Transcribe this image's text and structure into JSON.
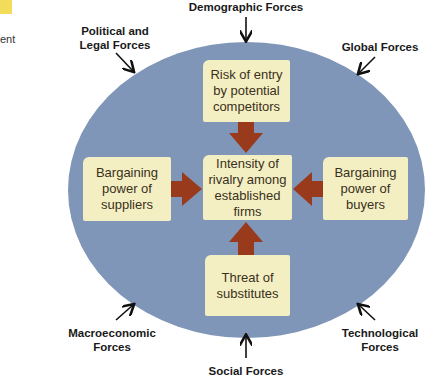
{
  "margin": {
    "fragment": "ent"
  },
  "colors": {
    "ellipse": "#7f96b8",
    "box": "#f4efc3",
    "arrow": "#9a3a1c",
    "tab": "#f2dc5a"
  },
  "forces": {
    "top": "Demographic Forces",
    "top_left": "Political and\nLegal Forces",
    "top_right": "Global Forces",
    "bottom_left": "Macroeconomic\nForces",
    "bottom": "Social Forces",
    "bottom_right": "Technological\nForces"
  },
  "boxes": {
    "top": "Risk of entry\nby potential\ncompetitors",
    "left": "Bargaining\npower of\nsuppliers",
    "center": "Intensity of\nrivalry among\nestablished\nfirms",
    "right": "Bargaining\npower of\nbuyers",
    "bottom": "Threat of\nsubstitutes"
  }
}
